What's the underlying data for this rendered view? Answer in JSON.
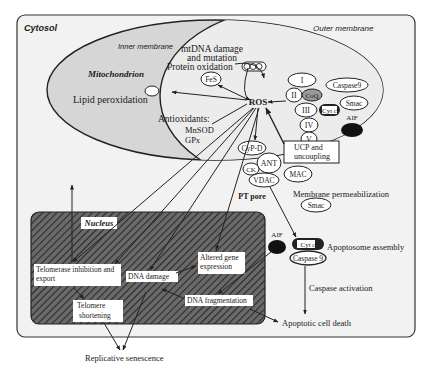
{
  "compartments": {
    "cytosol": "Cytosol",
    "outer_membrane": "Outer membrane",
    "inner_membrane": "Inner membrane",
    "mitochondrion": "Mitochondrion",
    "nucleus": "Nucleus"
  },
  "mito": {
    "mtdna_line1": "mtDNA damage",
    "mtdna_line2": "and mutation",
    "protein_oxidation": "Protein oxidation",
    "fes": "FeS",
    "lipid_peroxidation": "Lipid peroxidation",
    "ros": "ROS",
    "antioxidants": "Antioxidants:",
    "mnsod": "MnSOD",
    "gpx": "GPx",
    "complexes": [
      "I",
      "II",
      "III",
      "IV",
      "V"
    ],
    "coq": "CoQ",
    "cytc": "Cyt c",
    "caspase9": "Caspase9",
    "smac": "Smac",
    "aif": "AIF"
  },
  "pore": {
    "cypd": "CyP-D",
    "ant": "ANT",
    "ck": "CK",
    "vdac": "VDAC",
    "mac": "MAC",
    "pt_pore": "PT pore",
    "ucp_line1": "UCP and",
    "ucp_line2": "uncoupling"
  },
  "cytosol_events": {
    "membrane_permeabilization": "Membrane permeabilization",
    "smac": "Smac",
    "aif": "AIF",
    "cytc": "Cyt c",
    "caspase9": "Caspase 9",
    "apoptosome_assembly": "Apoptosome assembly",
    "caspase_activation": "Caspase activation",
    "apoptotic_cell_death": "Apoptotic cell death"
  },
  "nucleus_events": {
    "telomerase_line1": "Telomerase inhibition and",
    "telomerase_line2": "export",
    "telomere_line1": "Telomere",
    "telomere_line2": "shortening",
    "dna_damage": "DNA damage",
    "altered_line1": "Altered gene",
    "altered_line2": "expression",
    "dna_fragmentation": "DNA fragmentation"
  },
  "outcome": {
    "replicative_senescence": "Replicative senescence"
  },
  "colors": {
    "cytosol_bg": "#f2f2f2",
    "mito_fill": "#d6d6d6",
    "matrix_fill": "#eeeeee",
    "nucleus_fill": "#5a5a5a",
    "line": "#222222"
  }
}
